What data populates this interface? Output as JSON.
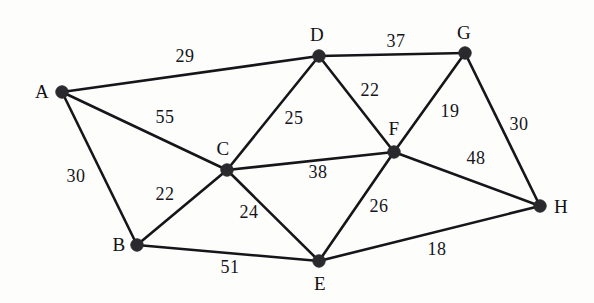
{
  "figure": {
    "type": "weighted-undirected-graph",
    "background_color": "#fdfdfc",
    "edge_color": "#16161a",
    "vertex_color": "#2a2a2e",
    "text_color": "#15151a"
  },
  "chart_data": {
    "type": "diagram",
    "subtype": "weighted-undirected-graph",
    "title": "",
    "vertex_count": 8,
    "edge_count": 15,
    "vertices": [
      {
        "id": "A",
        "label": "A",
        "x": 62,
        "y": 92,
        "label_x": 42,
        "label_y": 91
      },
      {
        "id": "B",
        "label": "B",
        "x": 137,
        "y": 245,
        "label_x": 119,
        "label_y": 244
      },
      {
        "id": "C",
        "label": "C",
        "x": 227,
        "y": 170,
        "label_x": 223,
        "label_y": 148
      },
      {
        "id": "D",
        "label": "D",
        "x": 319,
        "y": 56,
        "label_x": 317,
        "label_y": 34
      },
      {
        "id": "E",
        "label": "E",
        "x": 319,
        "y": 261,
        "label_x": 320,
        "label_y": 283
      },
      {
        "id": "F",
        "label": "F",
        "x": 394,
        "y": 152,
        "label_x": 394,
        "label_y": 128
      },
      {
        "id": "G",
        "label": "G",
        "x": 465,
        "y": 53,
        "label_x": 464,
        "label_y": 32
      },
      {
        "id": "H",
        "label": "H",
        "x": 540,
        "y": 206,
        "label_x": 561,
        "label_y": 206
      }
    ],
    "edges": [
      {
        "source": "A",
        "target": "D",
        "weight": 29,
        "label_x": 185,
        "label_y": 56
      },
      {
        "source": "A",
        "target": "C",
        "weight": 55,
        "label_x": 165,
        "label_y": 117
      },
      {
        "source": "A",
        "target": "B",
        "weight": 30,
        "label_x": 76,
        "label_y": 176
      },
      {
        "source": "B",
        "target": "C",
        "weight": 22,
        "label_x": 165,
        "label_y": 194
      },
      {
        "source": "B",
        "target": "E",
        "weight": 51,
        "label_x": 230,
        "label_y": 267
      },
      {
        "source": "C",
        "target": "D",
        "weight": 25,
        "label_x": 294,
        "label_y": 118
      },
      {
        "source": "C",
        "target": "E",
        "weight": 24,
        "label_x": 249,
        "label_y": 212
      },
      {
        "source": "C",
        "target": "F",
        "weight": 38,
        "label_x": 318,
        "label_y": 172
      },
      {
        "source": "D",
        "target": "F",
        "weight": 22,
        "label_x": 370,
        "label_y": 90
      },
      {
        "source": "D",
        "target": "G",
        "weight": 37,
        "label_x": 396,
        "label_y": 41
      },
      {
        "source": "F",
        "target": "G",
        "weight": 19,
        "label_x": 450,
        "label_y": 111
      },
      {
        "source": "F",
        "target": "E",
        "weight": 26,
        "label_x": 379,
        "label_y": 206
      },
      {
        "source": "F",
        "target": "H",
        "weight": 48,
        "label_x": 476,
        "label_y": 158
      },
      {
        "source": "G",
        "target": "H",
        "weight": 30,
        "label_x": 519,
        "label_y": 124
      },
      {
        "source": "E",
        "target": "H",
        "weight": 18,
        "label_x": 437,
        "label_y": 249
      }
    ],
    "adjacency": {
      "A": [
        "B",
        "C",
        "D"
      ],
      "B": [
        "A",
        "C",
        "E"
      ],
      "C": [
        "A",
        "B",
        "D",
        "E",
        "F"
      ],
      "D": [
        "A",
        "C",
        "F",
        "G"
      ],
      "E": [
        "B",
        "C",
        "F",
        "H"
      ],
      "F": [
        "C",
        "D",
        "E",
        "G",
        "H"
      ],
      "G": [
        "D",
        "F",
        "H"
      ],
      "H": [
        "E",
        "F",
        "G"
      ]
    }
  }
}
